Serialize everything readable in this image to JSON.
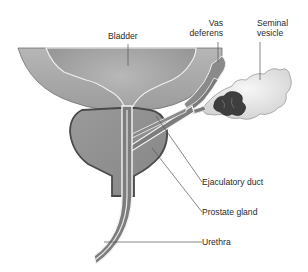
{
  "figure": {
    "type": "anatomical-illustration"
  },
  "labels": {
    "bladder": "Bladder",
    "vas_deferens_line1": "Vas",
    "vas_deferens_line2": "deferens",
    "seminal_vesicle_line1": "Seminal",
    "seminal_vesicle_line2": "vesicle",
    "ejaculatory_duct": "Ejaculatory duct",
    "prostate_gland": "Prostate gland",
    "urethra": "Urethra"
  },
  "colors": {
    "background": "#ffffff",
    "bladder_wall": "#a9a9a9",
    "bladder_lumen": "#9a9a9a",
    "prostate": "#8e8e8e",
    "prostate_outline": "#4a4a4a",
    "duct_fill": "#7d7d7d",
    "duct_highlight": "#f2f2f2",
    "seminal_vesicle": "#e6e6e6",
    "seminal_vesicle_inner": "#3e3e3e",
    "leader_line": "#555555",
    "text": "#2a2a2a"
  }
}
